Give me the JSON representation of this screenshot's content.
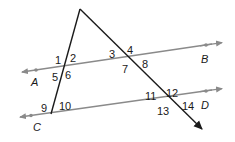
{
  "diagram": {
    "colors": {
      "parallel_lines": "#8a8a8a",
      "transversals": "#1a1a1a",
      "labels": "#1a1a1a"
    },
    "points": [
      {
        "label": "A",
        "x": 34,
        "y": 82
      },
      {
        "label": "B",
        "x": 201,
        "y": 63
      },
      {
        "label": "C",
        "x": 33,
        "y": 128
      },
      {
        "label": "D",
        "x": 201,
        "y": 108
      }
    ],
    "angles": [
      {
        "label": "1",
        "x": 55,
        "y": 64
      },
      {
        "label": "2",
        "x": 70,
        "y": 63
      },
      {
        "label": "3",
        "x": 109,
        "y": 57
      },
      {
        "label": "4",
        "x": 125,
        "y": 53
      },
      {
        "label": "5",
        "x": 51,
        "y": 80
      },
      {
        "label": "6",
        "x": 66,
        "y": 80
      },
      {
        "label": "7",
        "x": 122,
        "y": 73
      },
      {
        "label": "8",
        "x": 141,
        "y": 69
      },
      {
        "label": "9",
        "x": 41,
        "y": 112
      },
      {
        "label": "10",
        "x": 59,
        "y": 109
      },
      {
        "label": "11",
        "x": 145,
        "y": 100
      },
      {
        "label": "12",
        "x": 167,
        "y": 97
      },
      {
        "label": "13",
        "x": 158,
        "y": 116
      },
      {
        "label": "14",
        "x": 182,
        "y": 112
      }
    ]
  }
}
